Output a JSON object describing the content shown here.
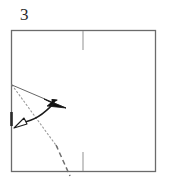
{
  "figure": {
    "step_label": "3",
    "type": "origami-fold-diagram",
    "caption": ""
  },
  "colors": {
    "paper_edge": "#6b6b6b",
    "fold_line": "#3a3a3a",
    "dotted_line": "#8a8a8a",
    "arrow_solid": "#1a1a1a",
    "arrow_hollow_fill": "#ffffff",
    "arrow_hollow_stroke": "#1a1a1a",
    "crease_tick": "#9a9a9a",
    "label_text": "#2b2b2b",
    "background": "#ffffff"
  },
  "geometry": {
    "square": {
      "x": 11,
      "y": 30,
      "width": 145,
      "height": 142
    },
    "tick_top": {
      "x": 83,
      "y1": 31,
      "y2": 50
    },
    "tick_bottom": {
      "x": 83,
      "y1": 152,
      "y2": 171
    },
    "edge_mark": {
      "x": 11,
      "y1": 112,
      "y2": 126
    },
    "fold_ray": {
      "x1": 11,
      "y1": 85,
      "x2": 64,
      "y2": 107
    },
    "dotted_ray": {
      "x1": 11,
      "y1": 85,
      "x2": 68,
      "y2": 188
    },
    "motion_arrow": {
      "from_x": 20,
      "from_y": 124,
      "to_x": 57,
      "to_y": 101
    }
  },
  "elements": {
    "square_name": "paper-square",
    "tick_top_name": "center-crease-tick-top",
    "tick_bottom_name": "center-crease-tick-bottom",
    "fold_ray_name": "fold-direction-line",
    "dotted_ray_name": "reference-dotted-line",
    "motion_arrow_name": "fold-motion-arrow",
    "edge_mark_name": "left-edge-mark"
  }
}
